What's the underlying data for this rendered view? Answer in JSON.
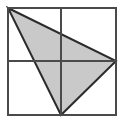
{
  "figure": {
    "title": "Shaded triangle inscribed in a square divided into four quadrants",
    "canvas": {
      "width": 123,
      "height": 122,
      "background": "#ffffff"
    },
    "colors": {
      "background": "#ffffff",
      "square_fill": "#ffffff",
      "square_stroke": "#4a4a4a",
      "midline_stroke": "#4a4a4a",
      "triangle_fill": "#c9c9c9",
      "triangle_stroke": "#2b2b2b"
    },
    "square": {
      "label": "outer square",
      "x": 8,
      "y": 8,
      "width": 108,
      "height": 107,
      "stroke_width": 2
    },
    "midlines": [
      {
        "label": "vertical midline",
        "orientation": "vertical",
        "x1": 61,
        "y1": 8,
        "x2": 61,
        "y2": 115,
        "stroke_width": 2
      },
      {
        "label": "horizontal midline",
        "orientation": "horizontal",
        "x1": 8,
        "y1": 61,
        "x2": 116,
        "y2": 61,
        "stroke_width": 2
      }
    ],
    "triangle": {
      "label": "shaded triangle",
      "points": "8,8 116,61 61,115",
      "stroke_width": 2,
      "vertices": [
        {
          "name": "top-left-corner",
          "x": 8,
          "y": 8
        },
        {
          "name": "right-edge-midpoint",
          "x": 116,
          "y": 61
        },
        {
          "name": "bottom-edge-midpoint",
          "x": 61,
          "y": 115
        }
      ]
    },
    "quadrants": [
      {
        "name": "top-left",
        "shaded": "fully"
      },
      {
        "name": "top-right",
        "shaded": "partially"
      },
      {
        "name": "bottom-left",
        "shaded": "partially"
      },
      {
        "name": "bottom-right",
        "shaded": "none"
      }
    ]
  }
}
